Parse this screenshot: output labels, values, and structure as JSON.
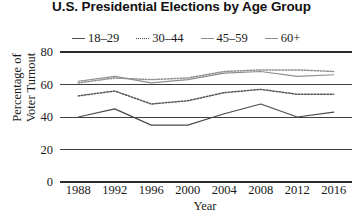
{
  "chart_data": {
    "type": "line",
    "title": "U.S. Presidential Elections by Age Group",
    "xlabel": "Year",
    "ylabel": "Percentage of\nVoter Turnout",
    "categories": [
      1988,
      1992,
      1996,
      2000,
      2004,
      2008,
      2012,
      2016
    ],
    "xtick_labels": [
      "1988",
      "1992",
      "1996",
      "2000",
      "2004",
      "2008",
      "2012",
      "2016"
    ],
    "ytick_labels": [
      "0",
      "20",
      "40",
      "60",
      "80"
    ],
    "ytick_values": [
      0,
      20,
      40,
      60,
      80
    ],
    "ylim": [
      0,
      80
    ],
    "grid": true,
    "legend_position": "top",
    "series": [
      {
        "name": "18–29",
        "style": "solid",
        "color": "#4a4a4a",
        "values": [
          40,
          45,
          35,
          35,
          42,
          48,
          40,
          43
        ]
      },
      {
        "name": "30–44",
        "style": "dotted",
        "color": "#555555",
        "values": [
          53,
          56,
          48,
          50,
          55,
          57,
          54,
          54
        ]
      },
      {
        "name": "45–59",
        "style": "solid",
        "color": "#8e8e8e",
        "values": [
          62,
          65,
          61,
          63,
          67,
          68,
          65,
          66
        ]
      },
      {
        "name": "60+",
        "style": "dotted",
        "color": "#8e8e8e",
        "values": [
          61,
          64,
          63,
          64,
          68,
          69,
          69,
          68
        ]
      }
    ]
  },
  "chart": {
    "title": "U.S. Presidential Elections by Age Group",
    "xlabel": "Year",
    "ylabel_line1": "Percentage of",
    "ylabel_line2": "Voter Turnout",
    "legend": [
      {
        "label": "18–29"
      },
      {
        "label": "30–44"
      },
      {
        "label": "45–59"
      },
      {
        "label": "60+"
      }
    ],
    "yticks": [
      {
        "label": "80"
      },
      {
        "label": "60"
      },
      {
        "label": "40"
      },
      {
        "label": "20"
      },
      {
        "label": "0"
      }
    ],
    "xticks": [
      {
        "label": "1988"
      },
      {
        "label": "1992"
      },
      {
        "label": "1996"
      },
      {
        "label": "2000"
      },
      {
        "label": "2004"
      },
      {
        "label": "2008"
      },
      {
        "label": "2012"
      },
      {
        "label": "2016"
      }
    ]
  }
}
